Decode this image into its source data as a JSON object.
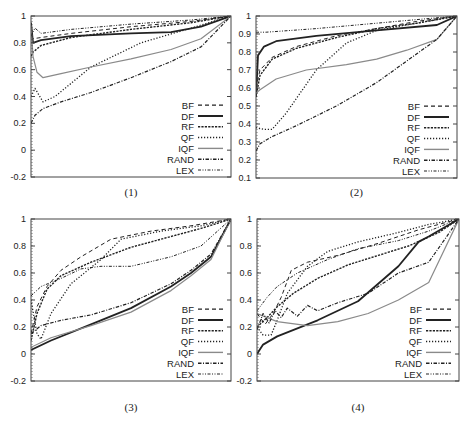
{
  "figure": {
    "background": "#ffffff",
    "line_color": "#222222",
    "iqf_color": "#8a8a8a"
  },
  "legend": {
    "entries": [
      {
        "name": "BF",
        "style": "dash"
      },
      {
        "name": "DF",
        "style": "solid-thick"
      },
      {
        "name": "RF",
        "style": "dense-dash"
      },
      {
        "name": "QF",
        "style": "dot"
      },
      {
        "name": "IQF",
        "style": "gray-solid"
      },
      {
        "name": "RAND",
        "style": "dash-dot"
      },
      {
        "name": "LEX",
        "style": "dash-dot-dot"
      }
    ]
  },
  "chart_data": [
    {
      "type": "line",
      "title": "(1)",
      "xlabel": "",
      "ylabel": "",
      "ylim": [
        -0.2,
        1.0
      ],
      "xlim": [
        0,
        1
      ],
      "yticks": [
        "1",
        "0.8",
        "0.6",
        "0.4",
        "0.2",
        "0",
        "-0.2"
      ],
      "ytick_values": [
        1,
        0.8,
        0.6,
        0.4,
        0.2,
        0,
        -0.2
      ],
      "grid": false,
      "legend_position": "lower right",
      "frame": {
        "left": 31,
        "right": 231,
        "top": 16,
        "bottom": 177
      },
      "caption": "(1)",
      "caption_y": 196,
      "series": [
        {
          "name": "BF",
          "x": [
            0,
            0.01,
            0.05,
            0.2,
            0.5,
            0.8,
            1.0
          ],
          "values": [
            0.85,
            0.83,
            0.84,
            0.87,
            0.92,
            0.96,
            1.0
          ]
        },
        {
          "name": "DF",
          "x": [
            0,
            0.01,
            0.05,
            0.2,
            0.5,
            0.7,
            0.85,
            1.0
          ],
          "values": [
            0.95,
            0.8,
            0.82,
            0.85,
            0.87,
            0.88,
            0.92,
            1.0
          ]
        },
        {
          "name": "RF",
          "x": [
            0,
            0.01,
            0.05,
            0.2,
            0.5,
            0.8,
            1.0
          ],
          "values": [
            0.7,
            0.73,
            0.78,
            0.84,
            0.9,
            0.95,
            1.0
          ]
        },
        {
          "name": "QF",
          "x": [
            0,
            0.02,
            0.06,
            0.12,
            0.3,
            0.55,
            0.8,
            1.0
          ],
          "values": [
            0.4,
            0.46,
            0.36,
            0.4,
            0.62,
            0.8,
            0.91,
            1.0
          ]
        },
        {
          "name": "IQF",
          "x": [
            0,
            0.01,
            0.03,
            0.06,
            0.15,
            0.3,
            0.5,
            0.7,
            0.85,
            1.0
          ],
          "values": [
            0.93,
            0.7,
            0.58,
            0.54,
            0.57,
            0.62,
            0.68,
            0.75,
            0.83,
            1.0
          ]
        },
        {
          "name": "RAND",
          "x": [
            0,
            0.02,
            0.06,
            0.15,
            0.3,
            0.5,
            0.7,
            0.85,
            1.0
          ],
          "values": [
            0.2,
            0.26,
            0.31,
            0.36,
            0.43,
            0.54,
            0.66,
            0.77,
            1.0
          ]
        },
        {
          "name": "LEX",
          "x": [
            0,
            0.02,
            0.05,
            0.2,
            0.5,
            0.8,
            1.0
          ],
          "values": [
            0.85,
            0.91,
            0.87,
            0.9,
            0.94,
            0.97,
            1.0
          ]
        }
      ]
    },
    {
      "type": "line",
      "title": "(2)",
      "xlabel": "",
      "ylabel": "",
      "ylim": [
        0.1,
        1.0
      ],
      "xlim": [
        0,
        1
      ],
      "yticks": [
        "1",
        "0.9",
        "0.8",
        "0.7",
        "0.6",
        "0.5",
        "0.4",
        "0.3",
        "0.2",
        "0.1"
      ],
      "ytick_values": [
        1,
        0.9,
        0.8,
        0.7,
        0.6,
        0.5,
        0.4,
        0.3,
        0.2,
        0.1
      ],
      "grid": false,
      "legend_position": "lower right",
      "frame": {
        "left": 256,
        "right": 457,
        "top": 16,
        "bottom": 178
      },
      "caption": "(2)",
      "caption_y": 196,
      "series": [
        {
          "name": "BF",
          "x": [
            0,
            0.02,
            0.08,
            0.2,
            0.4,
            0.6,
            0.8,
            1.0
          ],
          "values": [
            0.6,
            0.7,
            0.77,
            0.83,
            0.89,
            0.93,
            0.97,
            1.0
          ]
        },
        {
          "name": "DF",
          "x": [
            0,
            0.01,
            0.04,
            0.1,
            0.3,
            0.6,
            0.9,
            1.0
          ],
          "values": [
            0.55,
            0.78,
            0.83,
            0.86,
            0.89,
            0.92,
            0.95,
            1.0
          ]
        },
        {
          "name": "RF",
          "x": [
            0,
            0.02,
            0.08,
            0.2,
            0.4,
            0.6,
            0.8,
            1.0
          ],
          "values": [
            0.55,
            0.67,
            0.76,
            0.82,
            0.88,
            0.93,
            0.96,
            1.0
          ]
        },
        {
          "name": "QF",
          "x": [
            0,
            0.04,
            0.08,
            0.15,
            0.3,
            0.45,
            0.6,
            0.8,
            1.0
          ],
          "values": [
            0.38,
            0.37,
            0.37,
            0.46,
            0.7,
            0.85,
            0.92,
            0.96,
            1.0
          ]
        },
        {
          "name": "IQF",
          "x": [
            0,
            0.02,
            0.1,
            0.25,
            0.45,
            0.6,
            0.75,
            0.9,
            1.0
          ],
          "values": [
            0.57,
            0.59,
            0.65,
            0.7,
            0.73,
            0.76,
            0.81,
            0.87,
            1.0
          ]
        },
        {
          "name": "RAND",
          "x": [
            0,
            0.02,
            0.08,
            0.2,
            0.4,
            0.6,
            0.8,
            0.9,
            1.0
          ],
          "values": [
            0.25,
            0.29,
            0.33,
            0.39,
            0.5,
            0.63,
            0.79,
            0.87,
            1.0
          ]
        },
        {
          "name": "LEX",
          "x": [
            0,
            0.05,
            0.3,
            0.6,
            0.9,
            1.0
          ],
          "values": [
            0.91,
            0.91,
            0.93,
            0.96,
            0.99,
            1.0
          ]
        }
      ]
    },
    {
      "type": "line",
      "title": "(3)",
      "xlabel": "",
      "ylabel": "",
      "ylim": [
        -0.2,
        1.0
      ],
      "xlim": [
        0,
        1
      ],
      "yticks": [
        "1",
        "0.8",
        "0.6",
        "0.4",
        "0.2",
        "0",
        "-0.2"
      ],
      "ytick_values": [
        1,
        0.8,
        0.6,
        0.4,
        0.2,
        0,
        -0.2
      ],
      "grid": false,
      "legend_position": "lower right",
      "frame": {
        "left": 31,
        "right": 231,
        "top": 219,
        "bottom": 381
      },
      "caption": "(3)",
      "caption_y": 411,
      "series": [
        {
          "name": "BF",
          "x": [
            0,
            0.03,
            0.08,
            0.15,
            0.25,
            0.4,
            0.6,
            0.8,
            1.0
          ],
          "values": [
            0.15,
            0.35,
            0.5,
            0.62,
            0.72,
            0.85,
            0.91,
            0.95,
            1.0
          ]
        },
        {
          "name": "DF",
          "x": [
            0,
            0.1,
            0.3,
            0.5,
            0.7,
            0.8,
            0.9,
            1.0
          ],
          "values": [
            0.03,
            0.1,
            0.22,
            0.34,
            0.5,
            0.6,
            0.72,
            1.0
          ]
        },
        {
          "name": "RF",
          "x": [
            0,
            0.03,
            0.08,
            0.15,
            0.3,
            0.5,
            0.7,
            0.85,
            1.0
          ],
          "values": [
            0.1,
            0.3,
            0.48,
            0.58,
            0.68,
            0.79,
            0.87,
            0.93,
            1.0
          ]
        },
        {
          "name": "QF",
          "x": [
            0,
            0.03,
            0.05,
            0.1,
            0.2,
            0.35,
            0.45,
            0.65,
            0.85,
            1.0
          ],
          "values": [
            0.4,
            0.15,
            0.11,
            0.3,
            0.52,
            0.7,
            0.85,
            0.91,
            0.95,
            1.0
          ]
        },
        {
          "name": "IQF",
          "x": [
            0,
            0.1,
            0.3,
            0.5,
            0.7,
            0.8,
            0.9,
            1.0
          ],
          "values": [
            0.05,
            0.12,
            0.21,
            0.31,
            0.47,
            0.58,
            0.7,
            1.0
          ]
        },
        {
          "name": "RAND",
          "x": [
            0,
            0.05,
            0.15,
            0.3,
            0.5,
            0.7,
            0.8,
            0.9,
            1.0
          ],
          "values": [
            0.15,
            0.21,
            0.25,
            0.29,
            0.38,
            0.52,
            0.62,
            0.74,
            1.0
          ]
        },
        {
          "name": "LEX",
          "x": [
            0,
            0.05,
            0.15,
            0.25,
            0.35,
            0.5,
            0.7,
            0.85,
            1.0
          ],
          "values": [
            0.43,
            0.5,
            0.56,
            0.63,
            0.65,
            0.65,
            0.72,
            0.8,
            1.0
          ]
        }
      ]
    },
    {
      "type": "line",
      "title": "(4)",
      "xlabel": "",
      "ylabel": "",
      "ylim": [
        -0.2,
        1.0
      ],
      "xlim": [
        0,
        1
      ],
      "yticks": [
        "1",
        "0.8",
        "0.6",
        "0.4",
        "0.2",
        "0",
        "-0.2"
      ],
      "ytick_values": [
        1,
        0.8,
        0.6,
        0.4,
        0.2,
        0,
        -0.2
      ],
      "grid": false,
      "legend_position": "lower right",
      "frame": {
        "left": 257,
        "right": 459,
        "top": 219,
        "bottom": 381
      },
      "caption": "(4)",
      "caption_y": 411,
      "series": [
        {
          "name": "BF",
          "x": [
            0,
            0.04,
            0.08,
            0.12,
            0.17,
            0.25,
            0.4,
            0.6,
            0.8,
            1.0
          ],
          "values": [
            0.3,
            0.22,
            0.3,
            0.42,
            0.62,
            0.68,
            0.73,
            0.82,
            0.92,
            1.0
          ]
        },
        {
          "name": "DF",
          "x": [
            0,
            0.03,
            0.1,
            0.3,
            0.5,
            0.6,
            0.7,
            0.8,
            0.85,
            1.0
          ],
          "values": [
            0.0,
            0.07,
            0.13,
            0.25,
            0.39,
            0.52,
            0.65,
            0.83,
            0.87,
            1.0
          ]
        },
        {
          "name": "RF",
          "x": [
            0,
            0.05,
            0.1,
            0.18,
            0.3,
            0.45,
            0.6,
            0.75,
            0.9,
            1.0
          ],
          "values": [
            0.2,
            0.27,
            0.35,
            0.45,
            0.56,
            0.66,
            0.73,
            0.8,
            0.9,
            1.0
          ]
        },
        {
          "name": "QF",
          "x": [
            0,
            0.03,
            0.07,
            0.1,
            0.15,
            0.25,
            0.35,
            0.5,
            0.7,
            0.85,
            1.0
          ],
          "values": [
            0.2,
            0.14,
            0.14,
            0.25,
            0.45,
            0.65,
            0.76,
            0.83,
            0.9,
            0.96,
            1.0
          ]
        },
        {
          "name": "IQF",
          "x": [
            0,
            0.1,
            0.25,
            0.4,
            0.55,
            0.7,
            0.85,
            1.0
          ],
          "values": [
            0.3,
            0.24,
            0.21,
            0.24,
            0.3,
            0.4,
            0.53,
            1.0
          ]
        },
        {
          "name": "RAND",
          "x": [
            0,
            0.03,
            0.06,
            0.09,
            0.12,
            0.15,
            0.2,
            0.25,
            0.3,
            0.4,
            0.55,
            0.7,
            0.85,
            1.0
          ],
          "values": [
            0.18,
            0.3,
            0.23,
            0.32,
            0.27,
            0.34,
            0.28,
            0.36,
            0.32,
            0.38,
            0.45,
            0.6,
            0.68,
            1.0
          ]
        },
        {
          "name": "LEX",
          "x": [
            0,
            0.05,
            0.1,
            0.2,
            0.35,
            0.5,
            0.7,
            0.85,
            1.0
          ],
          "values": [
            0.32,
            0.42,
            0.5,
            0.6,
            0.7,
            0.78,
            0.84,
            0.91,
            1.0
          ]
        }
      ]
    }
  ]
}
